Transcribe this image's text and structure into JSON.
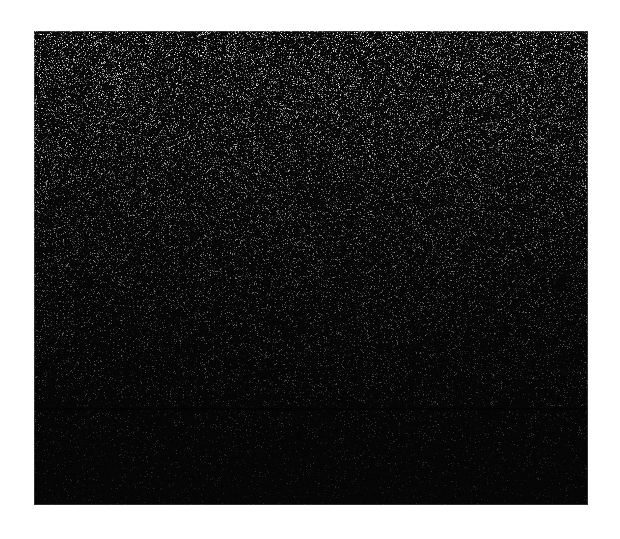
{
  "image": {
    "kind": "speckle-noise-texture",
    "title": "Dark speckled texture panel",
    "canvas": {
      "width": 620,
      "height": 539,
      "background_color": "#ffffff"
    },
    "panel": {
      "x": 34,
      "y": 31,
      "width": 554,
      "height": 474,
      "base_color": "#050505",
      "border_color": "#2a2a2a",
      "description": "Near-black rectangular region filled with dense fine-grained white and gray speckles"
    },
    "texture": {
      "speckle_color_bright": "#d8d8d8",
      "speckle_color_mid": "#8a8a8a",
      "speckle_color_dim": "#3a3a3a",
      "dot_size_px": 1,
      "density_top": "high",
      "density_bottom": "low",
      "gradient_direction": "top-bright-to-bottom-dark",
      "vertical_streaking": "faint",
      "horizontal_seam_y": 408
    },
    "labels": {
      "none_visible": ""
    }
  },
  "chart_data": {
    "type": "heatmap",
    "xlabel": "",
    "ylabel": "",
    "grid": false,
    "legend": "none",
    "xlim": [
      0,
      554
    ],
    "ylim": [
      0,
      474
    ],
    "rows_sampled": [
      "y=40",
      "y=120",
      "y=240",
      "y=360",
      "y=470"
    ],
    "mean_intensity_by_row": [
      26,
      20,
      15,
      10,
      8
    ],
    "peak_intensity": 216,
    "background_intensity": 5
  }
}
